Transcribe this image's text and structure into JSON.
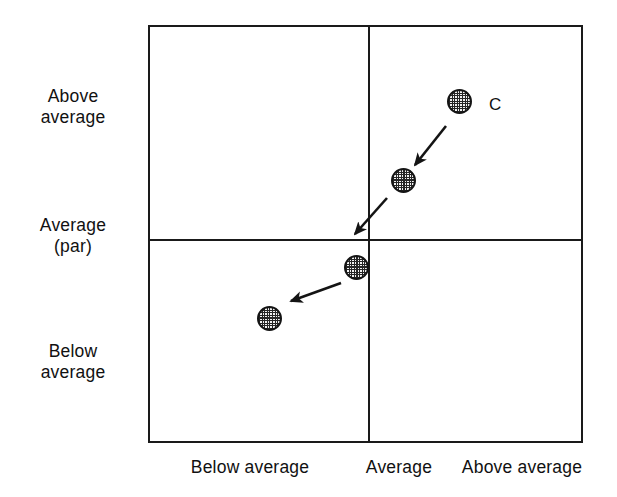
{
  "figure": {
    "background_color": "#ffffff",
    "line_color": "#1a1a1a",
    "marker_fill": "#f2f2f2",
    "marker_pattern": "checkered",
    "width": 617,
    "height": 497
  },
  "axes": {
    "y_labels": [
      {
        "id": "above-average",
        "text": "Above\naverage"
      },
      {
        "id": "average-par",
        "text": "Average\n(par)"
      },
      {
        "id": "below-average",
        "text": "Below\naverage"
      }
    ],
    "x_labels": [
      {
        "id": "below-average",
        "text": "Below average"
      },
      {
        "id": "average",
        "text": "Average"
      },
      {
        "id": "above-average",
        "text": "Above average"
      }
    ]
  },
  "annotations": {
    "series_label": "C"
  },
  "chart_data": {
    "type": "scatter",
    "title": "",
    "xlabel": "",
    "ylabel": "",
    "grid": false,
    "legend": null,
    "x_tick_labels": [
      "Below average",
      "Average",
      "Above average"
    ],
    "y_tick_labels": [
      "Below average",
      "Average (par)",
      "Above average"
    ],
    "x_category_boundary": "Average",
    "y_category_boundary": "Average (par)",
    "series": [
      {
        "name": "C",
        "label": "C",
        "description": "Trajectory of performance declining from above-average/above-average toward below-average/below-average",
        "points": [
          {
            "order": 1,
            "px": 459,
            "py": 101,
            "x_zone": "Above average",
            "y_zone": "Above average"
          },
          {
            "order": 2,
            "px": 403,
            "py": 180,
            "x_zone": "Above average",
            "y_zone": "Above average"
          },
          {
            "order": 3,
            "px": 356,
            "py": 267,
            "x_zone": "Below average",
            "y_zone": "Below average"
          },
          {
            "order": 4,
            "px": 269,
            "py": 318,
            "x_zone": "Below average",
            "y_zone": "Below average"
          }
        ],
        "arrows": [
          {
            "x1": 446,
            "y1": 126,
            "x2": 415,
            "y2": 165
          },
          {
            "x1": 387,
            "y1": 198,
            "x2": 355,
            "y2": 234
          },
          {
            "x1": 341,
            "y1": 283,
            "x2": 291,
            "y2": 301
          }
        ]
      }
    ],
    "label_positions": [
      {
        "text": "C",
        "px": 489,
        "py": 95
      }
    ]
  }
}
